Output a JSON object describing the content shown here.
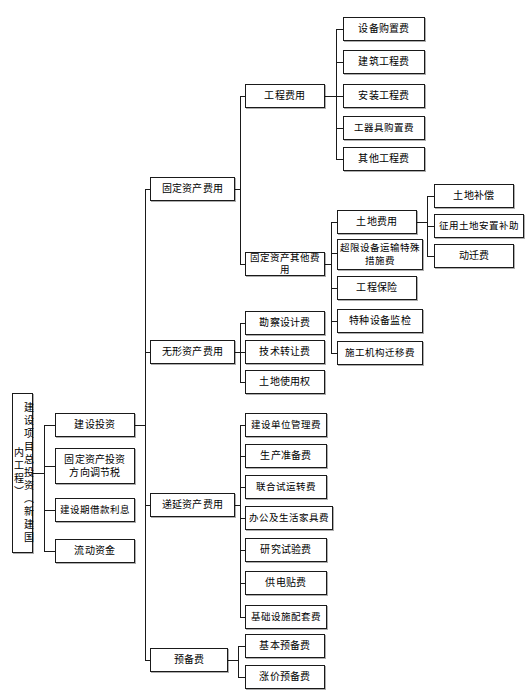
{
  "diagram": {
    "type": "tree-hierarchy",
    "orientation": "left-to-right",
    "root": {
      "id": "root",
      "label": "建设项目总投资（新建国内工程）"
    },
    "level2": [
      {
        "id": "l2-1",
        "label": "建设投资"
      },
      {
        "id": "l2-2",
        "label": "固定资产投资\n方向调节税",
        "line1": "固定资产投资",
        "line2": "方向调节税"
      },
      {
        "id": "l2-3",
        "label": "建设期借款利息"
      },
      {
        "id": "l2-4",
        "label": "流动资金"
      }
    ],
    "level3": [
      {
        "id": "l3-1",
        "label": "固定资产费用"
      },
      {
        "id": "l3-2",
        "label": "无形资产费用"
      },
      {
        "id": "l3-3",
        "label": "递延资产费用"
      },
      {
        "id": "l3-4",
        "label": "预备费"
      }
    ],
    "level4": [
      {
        "id": "l4-1",
        "label": "工程费用"
      },
      {
        "id": "l4-2",
        "label": "固定资产其他费用"
      }
    ],
    "engineering_costs": [
      {
        "id": "e1",
        "label": "设备购置费"
      },
      {
        "id": "e2",
        "label": "建筑工程费"
      },
      {
        "id": "e3",
        "label": "安装工程费"
      },
      {
        "id": "e4",
        "label": "工器具购置费"
      },
      {
        "id": "e5",
        "label": "其他工程费"
      }
    ],
    "fixed_asset_other_costs": [
      {
        "id": "f1",
        "label": "土地费用"
      },
      {
        "id": "f2",
        "label": "超限设备运输特殊\n措施费",
        "line1": "超限设备运输特殊",
        "line2": "措施费"
      },
      {
        "id": "f3",
        "label": "工程保险"
      },
      {
        "id": "f4",
        "label": "特种设备监检"
      },
      {
        "id": "f5",
        "label": "施工机构迁移费"
      }
    ],
    "land_costs": [
      {
        "id": "t1",
        "label": "土地补偿"
      },
      {
        "id": "t2",
        "label": "征用土地安置补助"
      },
      {
        "id": "t3",
        "label": "动迁费"
      }
    ],
    "intangible_costs": [
      {
        "id": "i1",
        "label": "勘察设计费"
      },
      {
        "id": "i2",
        "label": "技术转让费"
      },
      {
        "id": "i3",
        "label": "土地使用权"
      }
    ],
    "deferred_costs": [
      {
        "id": "d1",
        "label": "建设单位管理费"
      },
      {
        "id": "d2",
        "label": "生产准备费"
      },
      {
        "id": "d3",
        "label": "联合试运转费"
      },
      {
        "id": "d4",
        "label": "办公及生活家具费"
      },
      {
        "id": "d5",
        "label": "研究试验费"
      },
      {
        "id": "d6",
        "label": "供电贴费"
      },
      {
        "id": "d7",
        "label": "基础设施配套费"
      }
    ],
    "reserve_costs": [
      {
        "id": "r1",
        "label": "基本预备费"
      },
      {
        "id": "r2",
        "label": "涨价预备费"
      }
    ],
    "colors": {
      "line": "#1a1a1a",
      "box_fill": "#ffffff",
      "text": "#000000",
      "background": "#ffffff"
    }
  }
}
